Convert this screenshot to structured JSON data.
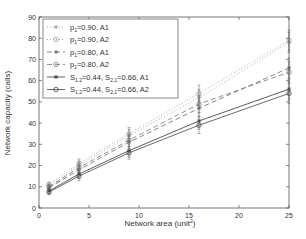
{
  "chart_data": {
    "type": "line",
    "title": "",
    "xlabel": "Network area (unit²)",
    "ylabel": "Network capacity (calls)",
    "xlim": [
      0,
      25
    ],
    "ylim": [
      0,
      90
    ],
    "xticks": [
      0,
      5,
      10,
      15,
      20,
      25
    ],
    "yticks": [
      0,
      10,
      20,
      30,
      40,
      50,
      60,
      70,
      80,
      90
    ],
    "grid": false,
    "legend_position": "upper left",
    "x": [
      1,
      4,
      9,
      16,
      25
    ],
    "series": [
      {
        "name": "p1=0.90, A1",
        "label_main": "p",
        "label_sub": "1",
        "label_rest": "=0.90, A1",
        "marker": "star",
        "dash": "1,2",
        "values": [
          10,
          20,
          34,
          52,
          78
        ]
      },
      {
        "name": "p1=0.90, A2",
        "label_main": "p",
        "label_sub": "1",
        "label_rest": "=0.90, A2",
        "marker": "circle",
        "dash": "1,2",
        "values": [
          11,
          21,
          35,
          54,
          79
        ]
      },
      {
        "name": "p1=0.80, A1",
        "label_main": "p",
        "label_sub": "1",
        "label_rest": "=0.80, A1",
        "marker": "star",
        "dash": "5,3",
        "values": [
          9.5,
          18,
          31,
          47,
          66
        ]
      },
      {
        "name": "p1=0.80, A2",
        "label_main": "p",
        "label_sub": "1",
        "label_rest": "=0.80, A2",
        "marker": "circle",
        "dash": "5,3",
        "values": [
          10,
          19,
          32,
          49,
          64
        ]
      },
      {
        "name": "S1,2=0.44, S2,1=0.66, A1",
        "marker": "star",
        "dash": "",
        "values": [
          8,
          16,
          27,
          41,
          56
        ]
      },
      {
        "name": "S1,2=0.44, S2,1=0.66, A2",
        "marker": "circle",
        "dash": "",
        "values": [
          7.5,
          15,
          26,
          39,
          54
        ]
      }
    ],
    "error_bars": true
  },
  "legend": {
    "s_label_a1": "S",
    "s_sub1": "1,2",
    "s_mid": "=0.44, S",
    "s_sub2": "2,1",
    "s_end_a1": "=0.66, A1",
    "s_end_a2": "=0.66, A2"
  },
  "axes": {
    "xlabel_main": "Network area (unit",
    "xlabel_sup": "2",
    "xlabel_close": ")",
    "ylabel": "Network capacity (calls)"
  }
}
